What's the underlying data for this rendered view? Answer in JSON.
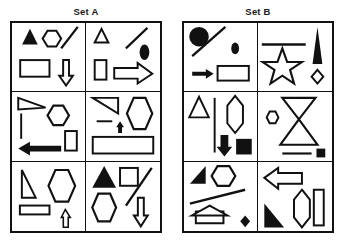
{
  "page": {
    "background_color": "#ffffff",
    "stroke_color": "#111111",
    "fill_color": "#111111"
  },
  "sets": [
    {
      "id": "set-a",
      "title": "Set A",
      "cells": [
        {
          "id": "a1",
          "position": "row1-col1",
          "shapes": [
            {
              "name": "filled-triangle",
              "fill": "solid"
            },
            {
              "name": "hexagon-outline",
              "fill": "outline"
            },
            {
              "name": "diagonal-line",
              "fill": "outline"
            },
            {
              "name": "rectangle-outline",
              "fill": "outline"
            },
            {
              "name": "down-arrow-outline",
              "fill": "outline"
            }
          ]
        },
        {
          "id": "a2",
          "position": "row1-col2",
          "shapes": [
            {
              "name": "small-triangle-outline",
              "fill": "outline"
            },
            {
              "name": "diagonal-line",
              "fill": "outline"
            },
            {
              "name": "filled-ellipse",
              "fill": "solid"
            },
            {
              "name": "vertical-rectangle-outline",
              "fill": "outline"
            },
            {
              "name": "right-arrow-outline",
              "fill": "outline"
            }
          ]
        },
        {
          "id": "a3",
          "position": "row2-col1",
          "shapes": [
            {
              "name": "right-triangle-outline",
              "fill": "outline"
            },
            {
              "name": "vertical-line",
              "fill": "outline"
            },
            {
              "name": "hexagon-outline",
              "fill": "outline"
            },
            {
              "name": "vertical-rectangle-outline",
              "fill": "outline"
            },
            {
              "name": "left-arrow-filled",
              "fill": "solid"
            }
          ]
        },
        {
          "id": "a4",
          "position": "row2-col2",
          "shapes": [
            {
              "name": "right-triangle-outline",
              "fill": "outline"
            },
            {
              "name": "short-horizontal-line",
              "fill": "outline"
            },
            {
              "name": "small-up-arrow-filled",
              "fill": "solid"
            },
            {
              "name": "hexagon-outline",
              "fill": "outline"
            },
            {
              "name": "wide-rectangle-outline",
              "fill": "outline"
            }
          ]
        },
        {
          "id": "a5",
          "position": "row3-col1",
          "shapes": [
            {
              "name": "right-triangle-outline",
              "fill": "outline"
            },
            {
              "name": "hexagon-outline",
              "fill": "outline"
            },
            {
              "name": "thin-rectangle-outline",
              "fill": "outline"
            },
            {
              "name": "small-up-arrow-outline",
              "fill": "outline"
            }
          ]
        },
        {
          "id": "a6",
          "position": "row3-col2",
          "shapes": [
            {
              "name": "filled-triangle",
              "fill": "solid"
            },
            {
              "name": "square-outline",
              "fill": "outline"
            },
            {
              "name": "diagonal-line",
              "fill": "outline"
            },
            {
              "name": "hexagon-outline",
              "fill": "outline"
            },
            {
              "name": "down-arrow-outline",
              "fill": "outline"
            }
          ]
        }
      ]
    },
    {
      "id": "set-b",
      "title": "Set B",
      "cells": [
        {
          "id": "b1",
          "position": "row1-col1",
          "shapes": [
            {
              "name": "filled-circle",
              "fill": "solid"
            },
            {
              "name": "diagonal-line",
              "fill": "outline"
            },
            {
              "name": "small-filled-ellipse",
              "fill": "solid"
            },
            {
              "name": "thin-right-arrow",
              "fill": "solid"
            },
            {
              "name": "rectangle-outline",
              "fill": "outline"
            }
          ]
        },
        {
          "id": "b2",
          "position": "row1-col2",
          "shapes": [
            {
              "name": "thick-horizontal-line",
              "fill": "solid"
            },
            {
              "name": "star-outline",
              "fill": "outline"
            },
            {
              "name": "tall-spike-triangle-filled",
              "fill": "solid"
            },
            {
              "name": "small-diamond-outline",
              "fill": "outline"
            }
          ]
        },
        {
          "id": "b3",
          "position": "row2-col1",
          "shapes": [
            {
              "name": "triangle-outline",
              "fill": "outline"
            },
            {
              "name": "vertical-line",
              "fill": "outline"
            },
            {
              "name": "elongated-hexagon-outline",
              "fill": "outline"
            },
            {
              "name": "down-arrow-filled",
              "fill": "solid"
            },
            {
              "name": "filled-square",
              "fill": "solid"
            }
          ]
        },
        {
          "id": "b4",
          "position": "row2-col2",
          "shapes": [
            {
              "name": "inverted-triangle-outline",
              "fill": "outline"
            },
            {
              "name": "small-hexagon-outline",
              "fill": "outline"
            },
            {
              "name": "triangle-outline",
              "fill": "outline"
            },
            {
              "name": "horizontal-line",
              "fill": "outline"
            },
            {
              "name": "small-filled-square",
              "fill": "solid"
            }
          ]
        },
        {
          "id": "b5",
          "position": "row3-col1",
          "shapes": [
            {
              "name": "filled-right-triangle",
              "fill": "solid"
            },
            {
              "name": "hexagon-outline",
              "fill": "outline"
            },
            {
              "name": "diagonal-line",
              "fill": "outline"
            },
            {
              "name": "up-arrow-outline",
              "fill": "outline"
            },
            {
              "name": "small-filled-diamond",
              "fill": "solid"
            }
          ]
        },
        {
          "id": "b6",
          "position": "row3-col2",
          "shapes": [
            {
              "name": "left-arrow-outline",
              "fill": "outline"
            },
            {
              "name": "elongated-hexagon-outline",
              "fill": "outline"
            },
            {
              "name": "vertical-rectangle-outline",
              "fill": "outline"
            },
            {
              "name": "filled-right-triangle",
              "fill": "solid"
            }
          ]
        }
      ]
    }
  ]
}
